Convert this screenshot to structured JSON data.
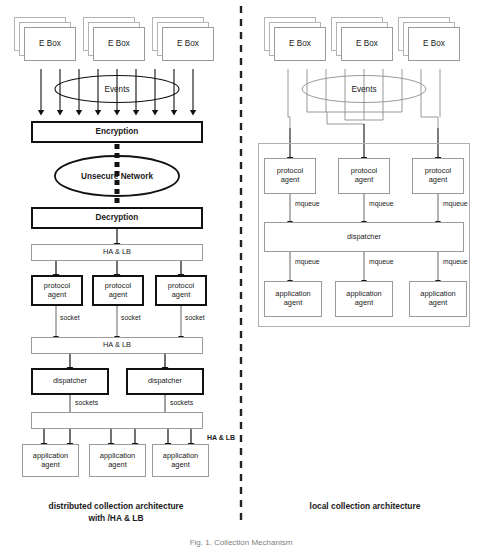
{
  "figure": {
    "divider": "dashed-vertical-divider",
    "caption_bottom": "Fig. 1.  Collection Mechanism"
  },
  "left_panel": {
    "caption": "distributed collection architecture\nwith /HA & LB",
    "ebox_label": "E Box",
    "ebox_count": 3,
    "ebox_stack_depth": 3,
    "events_label": "Events",
    "events_fan_lines": 9,
    "nodes": [
      {
        "id": "encryption",
        "label": "Encryption",
        "style": "thick-bold"
      },
      {
        "id": "unsecure-network",
        "label": "Unsecure Network",
        "style": "ellipse-bold"
      },
      {
        "id": "decryption",
        "label": "Decryption",
        "style": "thick-bold"
      },
      {
        "id": "halb-1",
        "label": "HA & LB",
        "style": "thin"
      },
      {
        "id": "halb-2",
        "label": "HA & LB",
        "style": "thin"
      },
      {
        "id": "halb-3",
        "label": "HA & LB",
        "style": "thin"
      }
    ],
    "protocol_agents": [
      {
        "line1": "protocol",
        "line2": "agent"
      },
      {
        "line1": "protocol",
        "line2": "agent"
      },
      {
        "line1": "protocol",
        "line2": "agent"
      }
    ],
    "dispatchers": [
      {
        "label": "dispatcher"
      },
      {
        "label": "dispatcher"
      }
    ],
    "application_agents": [
      {
        "line1": "application",
        "line2": "agent"
      },
      {
        "line1": "application",
        "line2": "agent"
      },
      {
        "line1": "application",
        "line2": "agent"
      }
    ],
    "edge_labels": {
      "socket": [
        "socket",
        "socket",
        "socket"
      ],
      "sockets": [
        "sockets",
        "sockets"
      ],
      "halb_side": "HA & LB"
    }
  },
  "right_panel": {
    "caption": "local collection architecture",
    "ebox_label": "E Box",
    "ebox_count": 3,
    "ebox_stack_depth": 3,
    "events_label": "Events",
    "events_fan_lines": 9,
    "protocol_agents": [
      {
        "line1": "protocol",
        "line2": "agent"
      },
      {
        "line1": "protocol",
        "line2": "agent"
      },
      {
        "line1": "protocol",
        "line2": "agent"
      }
    ],
    "dispatcher": {
      "label": "dispatcher"
    },
    "application_agents": [
      {
        "line1": "application",
        "line2": "agent"
      },
      {
        "line1": "application",
        "line2": "agent"
      },
      {
        "line1": "application",
        "line2": "agent"
      }
    ],
    "edge_labels": {
      "mqueue_upper": [
        "mqueue",
        "mqueue",
        "mqueue"
      ],
      "mqueue_lower": [
        "mqueue",
        "mqueue",
        "mqueue"
      ]
    }
  },
  "colors": {
    "ink": "#1a1a1a",
    "thin_border": "#9a9a9a",
    "thick_border": "#111111",
    "container_border": "#b0b0b0",
    "caption_grey": "#808080"
  }
}
